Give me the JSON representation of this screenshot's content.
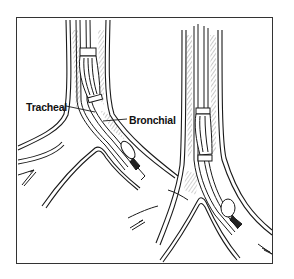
{
  "figure": {
    "labels": {
      "tracheal": "Tracheal",
      "bronchial": "Bronchial"
    },
    "panels": [
      {
        "name": "left-panel",
        "description": "Double-lumen tube with tracheal cuff in trachea and bronchial cuff in left mainstem bronchus"
      },
      {
        "name": "right-panel",
        "description": "Tube advanced with bronchial cuff inflated in bronchus"
      }
    ],
    "colors": {
      "line": "#1a1a1a",
      "frame": "#333333",
      "background": "#ffffff"
    }
  }
}
